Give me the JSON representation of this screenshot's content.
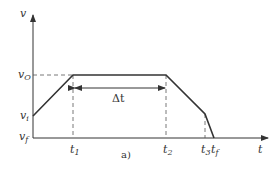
{
  "diagram": {
    "type": "velocity-time profile",
    "caption": "a)",
    "axes": {
      "y_label": "v",
      "x_label": "t"
    },
    "y_ticks": [
      {
        "base": "v",
        "sub": "O",
        "y": 75
      },
      {
        "base": "v",
        "sub": "i",
        "y": 116
      },
      {
        "base": "v",
        "sub": "f",
        "y": 138
      }
    ],
    "x_ticks": [
      {
        "base": "t",
        "sub": "1",
        "x": 73
      },
      {
        "base": "t",
        "sub": "2",
        "x": 166
      },
      {
        "base": "t",
        "sub": "3",
        "x": 205
      },
      {
        "base": "t",
        "sub": "f",
        "x": 214
      }
    ],
    "interval_label": "Δt",
    "profile_points": [
      [
        33,
        116
      ],
      [
        73,
        75
      ],
      [
        166,
        75
      ],
      [
        205,
        114
      ],
      [
        214,
        138
      ]
    ],
    "colors": {
      "line": "#333333",
      "dashed": "#555555",
      "background": "#ffffff"
    }
  }
}
